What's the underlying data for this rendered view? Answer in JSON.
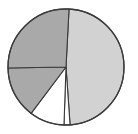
{
  "chart_data": {
    "type": "pie",
    "title": "",
    "subtitle": "",
    "xlabel": "",
    "ylabel": "",
    "grid": false,
    "legend": "none",
    "labels": [
      "Slice 1",
      "Slice 2",
      "Slice 3",
      "Slice 4",
      "Slice 5"
    ],
    "values": [
      48.1,
      1.7,
      9.7,
      14.4,
      26.1
    ],
    "start_angle_deg": 3,
    "direction": "clockwise",
    "colors": [
      "#d2d2d2",
      "#ffffff",
      "#ffffff",
      "#a9a9a9",
      "#a9a9a9"
    ],
    "edge_color": "#3a3a3a",
    "background": "#ffffff",
    "slices": [
      {
        "name": "slice-large-light-right",
        "label": "Slice 1",
        "value": 48.1,
        "percent": "48.1%",
        "start_deg": 3,
        "end_deg": 176,
        "color": "#d2d2d2"
      },
      {
        "name": "slice-thin-white-sliver",
        "label": "Slice 2",
        "value": 1.7,
        "percent": "1.7%",
        "start_deg": 176,
        "end_deg": 182,
        "color": "#ffffff"
      },
      {
        "name": "slice-white-bottom",
        "label": "Slice 3",
        "value": 9.7,
        "percent": "9.7%",
        "start_deg": 182,
        "end_deg": 217,
        "color": "#ffffff"
      },
      {
        "name": "slice-gray-lower-left",
        "label": "Slice 4",
        "value": 14.4,
        "percent": "14.4%",
        "start_deg": 217,
        "end_deg": 269,
        "color": "#a9a9a9"
      },
      {
        "name": "slice-gray-upper-left",
        "label": "Slice 5",
        "value": 26.1,
        "percent": "26.1%",
        "start_deg": 269,
        "end_deg": 363,
        "color": "#a9a9a9"
      }
    ],
    "geometry": {
      "center_x": 66,
      "center_y": 67,
      "radius": 58
    }
  }
}
